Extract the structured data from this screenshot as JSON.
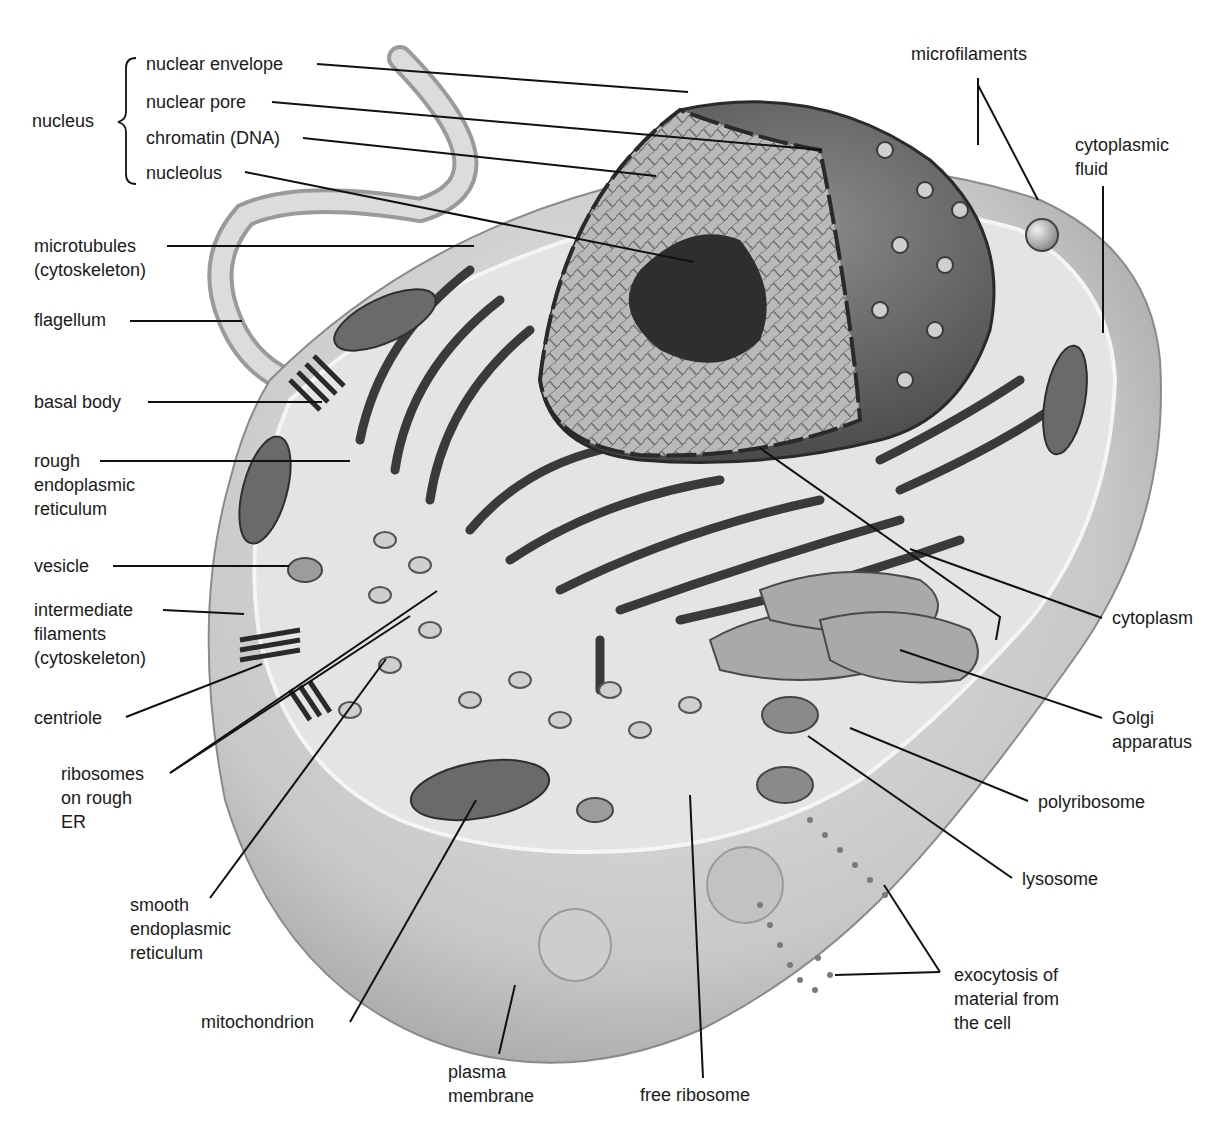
{
  "diagram": {
    "colors": {
      "background": "#ffffff",
      "label_text": "#1a1a1a",
      "leader_line": "#111111",
      "cell_fill": "#c9c9c9",
      "nucleus_fill": "#6e6e6e"
    },
    "group": {
      "label": "nucleus",
      "members": [
        "nuclear envelope",
        "nuclear pore",
        "chromatin (DNA)",
        "nucleolus"
      ]
    },
    "labels": {
      "nucleus": "nucleus",
      "nuclear_envelope": "nuclear envelope",
      "nuclear_pore": "nuclear pore",
      "chromatin": "chromatin (DNA)",
      "nucleolus": "nucleolus",
      "microtubules": "microtubules\n(cytoskeleton)",
      "flagellum": "flagellum",
      "basal_body": "basal body",
      "rough_er": "rough\nendoplasmic\nreticulum",
      "vesicle": "vesicle",
      "intermediate_filaments": "intermediate\nfilaments\n(cytoskeleton)",
      "centriole": "centriole",
      "ribosomes_rough_er": "ribosomes\non rough\nER",
      "smooth_er": "smooth\nendoplasmic\nreticulum",
      "mitochondrion": "mitochondrion",
      "plasma_membrane": "plasma\nmembrane",
      "free_ribosome": "free ribosome",
      "microfilaments": "microfilaments",
      "cytoplasmic_fluid": "cytoplasmic\nfluid",
      "cytoplasm": "cytoplasm",
      "golgi": "Golgi\napparatus",
      "polyribosome": "polyribosome",
      "lysosome": "lysosome",
      "exocytosis": "exocytosis of\nmaterial from\nthe cell"
    }
  }
}
